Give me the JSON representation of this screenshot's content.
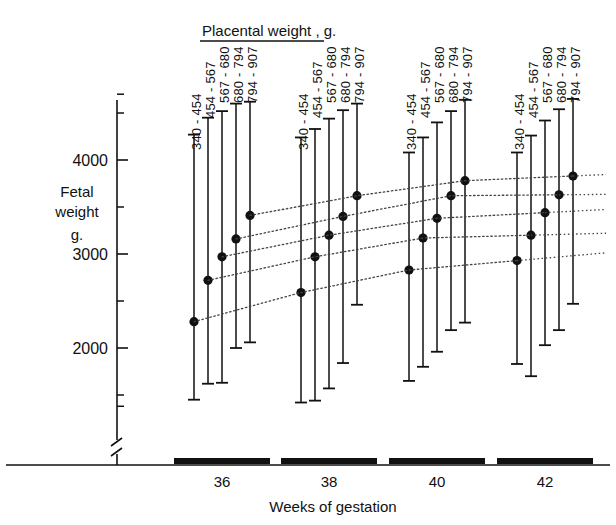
{
  "chart_data": {
    "type": "scatter",
    "title": "Placental weight , g.",
    "xlabel": "Weeks   of   gestation",
    "ylabel": "Fetal\nweight\ng.",
    "ylabel_lines": [
      "Fetal",
      "weight",
      "g."
    ],
    "categories": [
      "36",
      "38",
      "40",
      "42"
    ],
    "yticks_major": [
      2000,
      3000,
      4000
    ],
    "ytick_labels": [
      "2000",
      "3000",
      "4000"
    ],
    "yticks_minor": [
      1500,
      2500,
      3500,
      4500
    ],
    "ylim": [
      1200,
      4700
    ],
    "axis_break": true,
    "grid": false,
    "legend": "inline-rotated-labels",
    "series": [
      {
        "name": "340 - 454",
        "label": "340 - 454",
        "values": [
          2280,
          2590,
          2830,
          2930
        ],
        "lower": [
          1450,
          1420,
          1650,
          1830
        ],
        "upper": [
          4270,
          4240,
          4080,
          4080
        ]
      },
      {
        "name": "454 - 567",
        "label": "454 - 567",
        "values": [
          2720,
          2970,
          3170,
          3200
        ],
        "lower": [
          1620,
          1440,
          1800,
          1700
        ],
        "upper": [
          4450,
          4330,
          4240,
          4260
        ]
      },
      {
        "name": "567 - 680",
        "label": "567 - 680",
        "values": [
          2970,
          3200,
          3380,
          3440
        ],
        "lower": [
          1630,
          1570,
          1960,
          2030
        ],
        "upper": [
          4520,
          4440,
          4400,
          4420
        ]
      },
      {
        "name": "680 - 794",
        "label": "680 - 794",
        "values": [
          3160,
          3400,
          3620,
          3630
        ],
        "lower": [
          2000,
          1840,
          2190,
          2190
        ],
        "upper": [
          4600,
          4530,
          4520,
          4540
        ]
      },
      {
        "name": "794 - 907",
        "label": "794 - 907",
        "values": [
          3410,
          3620,
          3780,
          3830
        ],
        "lower": [
          2060,
          2460,
          2270,
          2470
        ],
        "upper": [
          4620,
          4600,
          4640,
          4650
        ]
      }
    ],
    "marker": "filled-circle",
    "connector": "dotted-line"
  },
  "colors": {
    "ink": "#111111",
    "background": "#ffffff",
    "connector": "#444444"
  }
}
